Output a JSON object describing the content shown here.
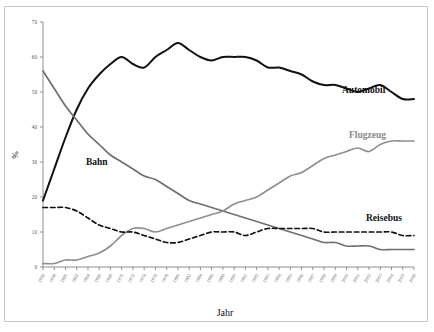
{
  "figure": {
    "y_axis_label": "%",
    "x_axis_title": "Jahr"
  },
  "labels": {
    "automobil": "Automobil",
    "flugzeug": "Flugzeug",
    "bahn": "Bahn",
    "reisebus": "Reisebus"
  },
  "colors": {
    "automobil": "#111111",
    "flugzeug": "#8f8f8f",
    "bahn": "#6f6f6f",
    "reisebus": "#111111",
    "axis": "#8e8e8e",
    "frame": "#c9c9c9",
    "background": "#ffffff"
  },
  "chart_data": {
    "type": "line",
    "title": "",
    "xlabel": "Jahr",
    "ylabel": "%",
    "ylim": [
      0,
      70
    ],
    "yticks": [
      0,
      10,
      20,
      30,
      40,
      50,
      60,
      70
    ],
    "grid": false,
    "legend": "inline-labels",
    "categories": [
      "1956",
      "1958",
      "1960",
      "1962",
      "1964",
      "1966",
      "1968",
      "1970",
      "1972",
      "1974",
      "1976",
      "1978",
      "1980",
      "1982",
      "1984",
      "1986",
      "1988",
      "1990",
      "1991",
      "1992",
      "1993",
      "1994",
      "1995",
      "1996",
      "1997",
      "1998",
      "1999",
      "2000",
      "2001",
      "2002",
      "2003",
      "2004",
      "2005",
      "2006"
    ],
    "series": [
      {
        "name": "Automobil",
        "color": "#111111",
        "style": "solid",
        "values": [
          19,
          28,
          37,
          45,
          51,
          55,
          58,
          60,
          58,
          57,
          60,
          62,
          64,
          62,
          60,
          59,
          60,
          60,
          60,
          59,
          57,
          57,
          56,
          55,
          53,
          52,
          52,
          51,
          50,
          51,
          52,
          50,
          48,
          48
        ]
      },
      {
        "name": "Bahn",
        "color": "#6f6f6f",
        "style": "solid",
        "values": [
          56,
          51,
          46,
          42,
          38,
          35,
          32,
          30,
          28,
          26,
          25,
          23,
          21,
          19,
          18,
          17,
          16,
          15,
          14,
          13,
          12,
          11,
          10,
          9,
          8,
          7,
          7,
          6,
          6,
          6,
          5,
          5,
          5,
          5
        ]
      },
      {
        "name": "Flugzeug",
        "color": "#8f8f8f",
        "style": "solid",
        "values": [
          1,
          1,
          2,
          2,
          3,
          4,
          6,
          9,
          11,
          11,
          10,
          11,
          12,
          13,
          14,
          15,
          16,
          18,
          19,
          20,
          22,
          24,
          26,
          27,
          29,
          31,
          32,
          33,
          34,
          33,
          35,
          36,
          36,
          36
        ]
      },
      {
        "name": "Reisebus",
        "color": "#111111",
        "style": "dashed",
        "values": [
          17,
          17,
          17,
          16,
          14,
          12,
          11,
          10,
          10,
          9,
          8,
          7,
          7,
          8,
          9,
          10,
          10,
          10,
          9,
          10,
          11,
          11,
          11,
          11,
          11,
          10,
          10,
          10,
          10,
          10,
          10,
          10,
          9,
          9
        ]
      }
    ]
  }
}
